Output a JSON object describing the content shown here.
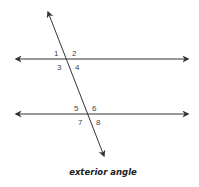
{
  "diagram": {
    "caption": "exterior angle",
    "line_color": "#333333",
    "label_color": "#444444",
    "parallel_lines": [
      {
        "name": "upper",
        "y": 59,
        "x1": 14,
        "x2": 190
      },
      {
        "name": "lower",
        "y": 114,
        "x1": 14,
        "x2": 190
      }
    ],
    "transversal": {
      "x1": 47,
      "y1": 10,
      "x2": 105,
      "y2": 158
    },
    "angle_labels": [
      {
        "id": "1",
        "text": "1"
      },
      {
        "id": "2",
        "text": "2"
      },
      {
        "id": "3",
        "text": "3"
      },
      {
        "id": "4",
        "text": "4"
      },
      {
        "id": "5",
        "text": "5"
      },
      {
        "id": "6",
        "text": "6"
      },
      {
        "id": "7",
        "text": "7"
      },
      {
        "id": "8",
        "text": "8"
      }
    ]
  }
}
